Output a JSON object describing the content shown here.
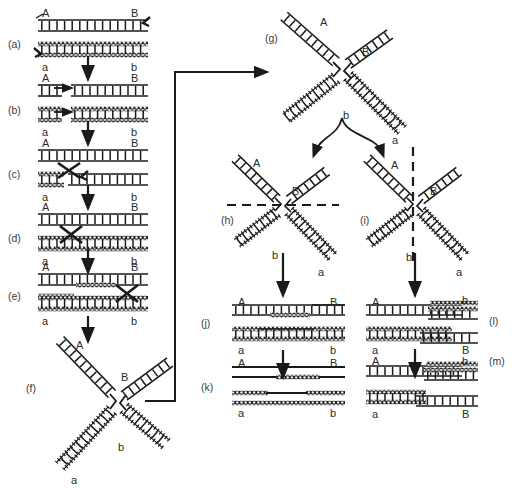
{
  "figure": {
    "panel_count": 13,
    "bottom_caption": ""
  },
  "colors": {
    "ink": "#1a1a1a",
    "label": "#2b2b2b",
    "panel_id": "#3a3a3a",
    "background": "#ffffff",
    "strand_plain": "#1a1a1a",
    "strand_shaded": "#111111"
  },
  "panels": [
    {
      "id": "a",
      "label": "(a)",
      "x": 8,
      "y": 38,
      "description": "Two homologous duplexes aligned; nicks introduced in one strand of each",
      "end_labels": [
        {
          "text": "A",
          "x": 42,
          "y": 8
        },
        {
          "text": "B",
          "x": 131,
          "y": 8
        },
        {
          "text": "a",
          "x": 42,
          "y": 62
        },
        {
          "text": "b",
          "x": 131,
          "y": 62
        }
      ]
    },
    {
      "id": "b",
      "label": "(b)",
      "x": 8,
      "y": 104,
      "description": "Nicked strands separate; free ends begin strand invasion",
      "end_labels": [
        {
          "text": "A",
          "x": 42,
          "y": 73
        },
        {
          "text": "B",
          "x": 131,
          "y": 73
        },
        {
          "text": "a",
          "x": 42,
          "y": 127
        },
        {
          "text": "b",
          "x": 131,
          "y": 127
        }
      ]
    },
    {
      "id": "c",
      "label": "(c)",
      "x": 8,
      "y": 168,
      "description": "Reciprocal strand exchange between the two duplexes",
      "end_labels": [
        {
          "text": "A",
          "x": 42,
          "y": 138
        },
        {
          "text": "B",
          "x": 131,
          "y": 138
        },
        {
          "text": "a",
          "x": 42,
          "y": 192
        },
        {
          "text": "b",
          "x": 131,
          "y": 192
        }
      ]
    },
    {
      "id": "d",
      "label": "(d)",
      "x": 8,
      "y": 232,
      "description": "Ligation creates the Holliday junction crossover",
      "end_labels": [
        {
          "text": "A",
          "x": 42,
          "y": 202
        },
        {
          "text": "B",
          "x": 131,
          "y": 202
        },
        {
          "text": "a",
          "x": 42,
          "y": 256
        },
        {
          "text": "b",
          "x": 131,
          "y": 256
        }
      ]
    },
    {
      "id": "e",
      "label": "(e)",
      "x": 8,
      "y": 290,
      "description": "Branch migration extends the heteroduplex region",
      "end_labels": [
        {
          "text": "A",
          "x": 42,
          "y": 262
        },
        {
          "text": "B",
          "x": 131,
          "y": 262
        },
        {
          "text": "a",
          "x": 42,
          "y": 316
        },
        {
          "text": "b",
          "x": 131,
          "y": 316
        }
      ]
    },
    {
      "id": "f",
      "label": "(f)",
      "x": 26,
      "y": 382,
      "description": "Chi-form isomerization of the junction drawn as a cross",
      "end_labels": [
        {
          "text": "A",
          "x": 76,
          "y": 340
        },
        {
          "text": "B",
          "x": 121,
          "y": 372
        },
        {
          "text": "b",
          "x": 118,
          "y": 442
        },
        {
          "text": "a",
          "x": 71,
          "y": 475
        }
      ]
    },
    {
      "id": "g",
      "label": "(g)",
      "x": 265,
      "y": 32,
      "description": "Open chi-form Holliday junction prior to resolution",
      "end_labels": [
        {
          "text": "A",
          "x": 320,
          "y": 17
        },
        {
          "text": "B",
          "x": 362,
          "y": 47
        },
        {
          "text": "b",
          "x": 343,
          "y": 110
        },
        {
          "text": "a",
          "x": 392,
          "y": 135
        }
      ]
    },
    {
      "id": "h",
      "label": "(h)",
      "x": 221,
      "y": 214,
      "description": "Horizontal resolution cut across the junction (dashed line)",
      "cut_orientation": "horizontal",
      "end_labels": [
        {
          "text": "A",
          "x": 253,
          "y": 158
        },
        {
          "text": "B",
          "x": 292,
          "y": 186
        },
        {
          "text": "b",
          "x": 272,
          "y": 250
        },
        {
          "text": "a",
          "x": 318,
          "y": 267
        }
      ]
    },
    {
      "id": "i",
      "label": "(i)",
      "x": 360,
      "y": 214,
      "description": "Vertical resolution cut across the junction (dashed line)",
      "cut_orientation": "vertical",
      "end_labels": [
        {
          "text": "A",
          "x": 391,
          "y": 160
        },
        {
          "text": "B",
          "x": 430,
          "y": 186
        },
        {
          "text": "b",
          "x": 406,
          "y": 252
        },
        {
          "text": "a",
          "x": 456,
          "y": 267
        }
      ]
    },
    {
      "id": "j",
      "label": "(j)",
      "x": 201,
      "y": 317,
      "description": "Non-crossover (patch) products with heteroduplex segments",
      "end_labels": [
        {
          "text": "A",
          "x": 238,
          "y": 297
        },
        {
          "text": "B",
          "x": 330,
          "y": 297
        },
        {
          "text": "a",
          "x": 238,
          "y": 345
        },
        {
          "text": "b",
          "x": 330,
          "y": 345
        }
      ]
    },
    {
      "id": "k",
      "label": "(k)",
      "x": 201,
      "y": 381,
      "description": "Parental flanking markers retained: A-B and a-b",
      "end_labels": [
        {
          "text": "A",
          "x": 238,
          "y": 358
        },
        {
          "text": "B",
          "x": 330,
          "y": 358
        },
        {
          "text": "a",
          "x": 238,
          "y": 408
        },
        {
          "text": "b",
          "x": 330,
          "y": 408
        }
      ]
    },
    {
      "id": "l",
      "label": "(l)",
      "x": 489,
      "y": 315,
      "description": "Crossover (splice) products with recombined flanking markers",
      "end_labels": [
        {
          "text": "A",
          "x": 372,
          "y": 297
        },
        {
          "text": "b",
          "x": 462,
          "y": 295
        },
        {
          "text": "a",
          "x": 372,
          "y": 345
        },
        {
          "text": "B",
          "x": 462,
          "y": 345
        }
      ]
    },
    {
      "id": "m",
      "label": "(m)",
      "x": 489,
      "y": 355,
      "description": "Recombinant duplexes A-b and a-B after ligation",
      "end_labels": [
        {
          "text": "A",
          "x": 372,
          "y": 356
        },
        {
          "text": "b",
          "x": 462,
          "y": 356
        },
        {
          "text": "a",
          "x": 372,
          "y": 409
        },
        {
          "text": "B",
          "x": 462,
          "y": 409
        }
      ]
    }
  ],
  "flow_arrows": [
    {
      "name": "a-to-b",
      "type": "straight-down",
      "x": 88,
      "y1": 56,
      "y2": 74
    },
    {
      "name": "b-to-c",
      "type": "straight-down",
      "x": 88,
      "y1": 121,
      "y2": 139
    },
    {
      "name": "c-to-d",
      "type": "straight-down",
      "x": 88,
      "y1": 185,
      "y2": 203
    },
    {
      "name": "d-to-e",
      "type": "straight-down",
      "x": 88,
      "y1": 249,
      "y2": 267
    },
    {
      "name": "e-to-f",
      "type": "straight-down",
      "x": 88,
      "y1": 316,
      "y2": 336
    },
    {
      "name": "f-to-g",
      "type": "elbow-right-up",
      "from_x": 145,
      "from_y": 401,
      "to_x": 262,
      "to_y": 72
    },
    {
      "name": "g-to-h",
      "type": "curved-down-left",
      "from_x": 342,
      "from_y": 118,
      "to_x": 315,
      "to_y": 152
    },
    {
      "name": "g-to-i",
      "type": "curved-down-right",
      "from_x": 342,
      "from_y": 118,
      "to_x": 382,
      "to_y": 152
    },
    {
      "name": "h-to-j",
      "type": "straight-down",
      "x": 283,
      "y1": 253,
      "y2": 290
    },
    {
      "name": "i-to-l",
      "type": "straight-down",
      "x": 415,
      "y1": 253,
      "y2": 290
    },
    {
      "name": "j-to-k",
      "type": "straight-down",
      "x": 283,
      "y1": 350,
      "y2": 372
    },
    {
      "name": "l-to-m",
      "type": "straight-down",
      "x": 415,
      "y1": 349,
      "y2": 371
    }
  ],
  "legend": {
    "plain_strand": "parental duplex 1 (open ladder)",
    "shaded_strand": "parental duplex 2 (hatched ladder)"
  }
}
